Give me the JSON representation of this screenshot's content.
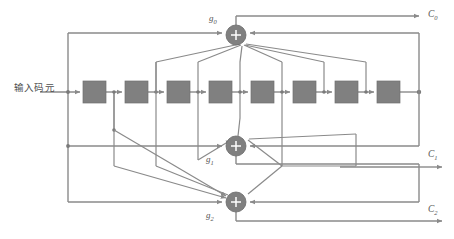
{
  "diagram": {
    "type": "convolutional-encoder-block-diagram",
    "title_visible": false,
    "input": {
      "label": "输入码元",
      "x": 14,
      "y": 83
    },
    "registers": {
      "count": 8,
      "label_visible": false,
      "fill_color": "#808080",
      "width": 23,
      "height": 22,
      "y": 81,
      "x_positions": [
        83,
        125,
        167,
        209,
        251,
        293,
        335,
        377
      ]
    },
    "adders": [
      {
        "id": "g0",
        "label": "g",
        "subscript": "0",
        "cx": 236,
        "cy": 35,
        "r": 10
      },
      {
        "id": "g1",
        "label": "g",
        "subscript": "1",
        "cx": 236,
        "cy": 146,
        "r": 10
      },
      {
        "id": "g2",
        "label": "g",
        "subscript": "2",
        "cx": 236,
        "cy": 202,
        "r": 10
      }
    ],
    "outputs": [
      {
        "id": "c0",
        "label": "C",
        "subscript": "0",
        "x": 428,
        "y": 14
      },
      {
        "id": "c1",
        "label": "C",
        "subscript": "1",
        "x": 428,
        "y": 150
      },
      {
        "id": "c2",
        "label": "C",
        "subscript": "2",
        "x": 428,
        "y": 205
      }
    ],
    "colors": {
      "wire": "#8a8a8a",
      "block_fill": "#808080",
      "adder_fill": "#808080",
      "plus_sign": "#ffffff",
      "text": "#555555",
      "background": "#ffffff"
    }
  }
}
